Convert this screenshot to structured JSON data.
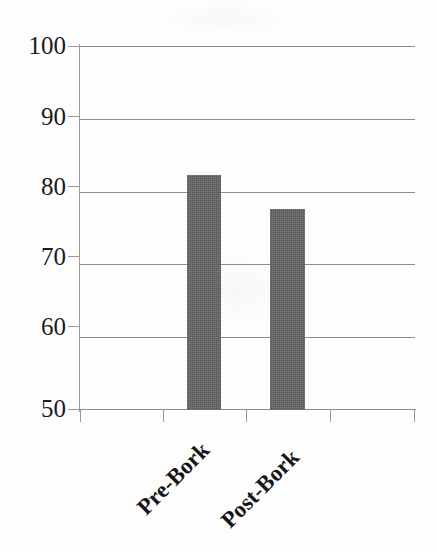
{
  "chart_data": {
    "type": "bar",
    "title": "",
    "subtitle": "",
    "xlabel": "",
    "ylabel": "",
    "categories": [
      "Pre-Bork",
      "Post-Bork"
    ],
    "values": [
      82.3,
      77.6
    ],
    "series": [
      {
        "name": "",
        "values": [
          82.3,
          77.6
        ]
      }
    ],
    "ylim": [
      50,
      100
    ],
    "yticks": [
      "50",
      "60",
      "70",
      "80",
      "90",
      "100"
    ],
    "ytick_values": [
      50,
      60,
      70,
      80,
      90,
      100
    ],
    "grid": true,
    "grid_axis": "y",
    "legend": false,
    "legend_position": "none",
    "bar_color": "#595959",
    "gridline_color": "#8c8c8c",
    "axis_color": "#9a9a9a",
    "text_color": "#1b1b1b",
    "background_color": "#fdfdfd",
    "annotations": []
  },
  "axes": {
    "y": {
      "ticks": [
        {
          "label": "100",
          "value": 100
        },
        {
          "label": "90",
          "value": 90
        },
        {
          "label": "80",
          "value": 80
        },
        {
          "label": "70",
          "value": 70
        },
        {
          "label": "60",
          "value": 60
        },
        {
          "label": "50",
          "value": 50
        }
      ]
    },
    "x": {
      "ticks": [
        {
          "label": "Pre-Bork"
        },
        {
          "label": "Post-Bork"
        }
      ]
    }
  }
}
